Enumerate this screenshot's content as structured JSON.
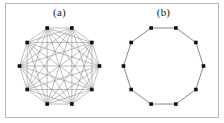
{
  "figure": {
    "width": 224,
    "height": 123,
    "background_color": "#ffffff",
    "frame_color": "#b9b9b9"
  },
  "panels": [
    {
      "id": "a",
      "label": "(a)",
      "graph_name": "dense-complete-graph",
      "node_count": 10,
      "edge_style": "all-pairs",
      "node_color": "#111111",
      "edge_color": "#6e6e6e"
    },
    {
      "id": "b",
      "label": "(b)",
      "graph_name": "cycle-ring-graph",
      "node_count": 10,
      "edge_style": "ring",
      "node_color": "#111111",
      "edge_color": "#555555"
    }
  ],
  "chart_data": {
    "type": "diagram",
    "title": "",
    "subtitle": "",
    "xlabel": "",
    "ylabel": "",
    "grid": false,
    "legend": "none",
    "graphs": [
      {
        "panel": "(a)",
        "layout": "circular",
        "nodes": 10,
        "node_ids": [
          0,
          1,
          2,
          3,
          4,
          5,
          6,
          7,
          8,
          9
        ],
        "topology": "complete",
        "edges": 45,
        "degree": 9,
        "description": "Complete graph K10 drawn with nodes on a circle; every pair of nodes joined by a straight chord."
      },
      {
        "panel": "(b)",
        "layout": "circular",
        "nodes": 10,
        "node_ids": [
          0,
          1,
          2,
          3,
          4,
          5,
          6,
          7,
          8,
          9
        ],
        "topology": "cycle",
        "edges": 10,
        "degree": 2,
        "description": "Cycle graph C10 drawn as a regular decagon; each node joined only to its two circular neighbours."
      }
    ]
  }
}
